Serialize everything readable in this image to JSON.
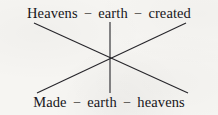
{
  "figure": {
    "name": "chiasmus-diagram",
    "background_color": "#f6f5f2",
    "ink_color": "#26252a"
  },
  "top_row": {
    "terms": [
      "Heavens",
      "earth",
      "created"
    ],
    "separator": "–"
  },
  "bottom_row": {
    "terms": [
      "Made",
      "earth",
      "heavens"
    ],
    "separator": "–"
  },
  "connectors": {
    "description": "Three straight lines meeting at one central crossing point",
    "intersection": {
      "x": 110,
      "y": 59
    },
    "lines": [
      {
        "name": "diagonal-heavens-to-heavens",
        "from_term": "Heavens",
        "to_term": "heavens",
        "x1": 34,
        "y1": 23,
        "x2": 188,
        "y2": 93
      },
      {
        "name": "diagonal-created-to-made",
        "from_term": "created",
        "to_term": "Made",
        "x1": 186,
        "y1": 23,
        "x2": 37,
        "y2": 93
      },
      {
        "name": "vertical-earth-to-earth",
        "from_term": "earth",
        "to_term": "earth",
        "x1": 110,
        "y1": 22,
        "x2": 110,
        "y2": 93
      }
    ]
  }
}
